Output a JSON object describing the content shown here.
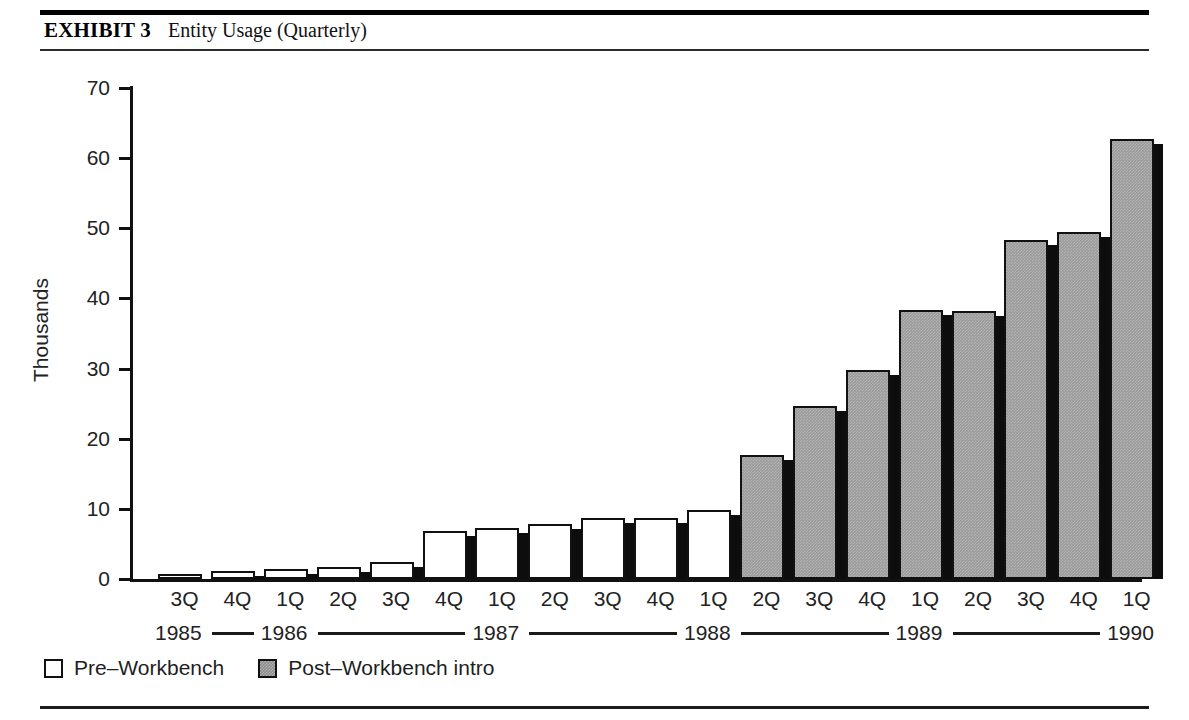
{
  "exhibit": {
    "tag": "EXHIBIT 3",
    "title": "Entity Usage (Quarterly)"
  },
  "chart_data": {
    "type": "bar",
    "title": "Entity Usage (Quarterly)",
    "xlabel": "",
    "ylabel": "Thousands",
    "ylim": [
      0,
      70
    ],
    "ytick_step": 10,
    "yticks": [
      "70",
      "60",
      "50",
      "40",
      "30",
      "20",
      "10",
      "0"
    ],
    "grid": false,
    "legend_position": "bottom-left",
    "categories": [
      "3Q",
      "4Q",
      "1Q",
      "2Q",
      "3Q",
      "4Q",
      "1Q",
      "2Q",
      "3Q",
      "4Q",
      "1Q",
      "2Q",
      "3Q",
      "4Q",
      "1Q",
      "2Q",
      "3Q",
      "4Q",
      "1Q"
    ],
    "years": [
      {
        "label": "1985",
        "span": 2
      },
      {
        "label": "1986",
        "span": 4
      },
      {
        "label": "1987",
        "span": 4
      },
      {
        "label": "1988",
        "span": 4
      },
      {
        "label": "1989",
        "span": 4
      },
      {
        "label": "1990",
        "span": 1
      }
    ],
    "series": [
      {
        "name": "Pre–Workbench",
        "color": "#ffffff",
        "values": [
          0.7,
          1.1,
          1.4,
          1.7,
          2.4,
          6.8,
          7.2,
          7.9,
          8.7,
          8.7,
          9.9,
          null,
          null,
          null,
          null,
          null,
          null,
          null,
          null
        ]
      },
      {
        "name": "Post–Workbench intro",
        "color": "#9a9a9a",
        "values": [
          null,
          null,
          null,
          null,
          null,
          null,
          null,
          null,
          null,
          null,
          null,
          17.7,
          24.7,
          29.8,
          38.3,
          38.2,
          48.3,
          49.5,
          62.8
        ]
      }
    ],
    "bars": [
      {
        "quarter": "3Q",
        "year": "1985",
        "value": 0.7,
        "series": "Pre–Workbench"
      },
      {
        "quarter": "4Q",
        "year": "1985",
        "value": 1.1,
        "series": "Pre–Workbench"
      },
      {
        "quarter": "1Q",
        "year": "1986",
        "value": 1.4,
        "series": "Pre–Workbench"
      },
      {
        "quarter": "2Q",
        "year": "1986",
        "value": 1.7,
        "series": "Pre–Workbench"
      },
      {
        "quarter": "3Q",
        "year": "1986",
        "value": 2.4,
        "series": "Pre–Workbench"
      },
      {
        "quarter": "4Q",
        "year": "1986",
        "value": 6.8,
        "series": "Pre–Workbench"
      },
      {
        "quarter": "1Q",
        "year": "1987",
        "value": 7.2,
        "series": "Pre–Workbench"
      },
      {
        "quarter": "2Q",
        "year": "1987",
        "value": 7.9,
        "series": "Pre–Workbench"
      },
      {
        "quarter": "3Q",
        "year": "1987",
        "value": 8.7,
        "series": "Pre–Workbench"
      },
      {
        "quarter": "4Q",
        "year": "1987",
        "value": 8.7,
        "series": "Pre–Workbench"
      },
      {
        "quarter": "1Q",
        "year": "1988",
        "value": 9.9,
        "series": "Pre–Workbench"
      },
      {
        "quarter": "2Q",
        "year": "1988",
        "value": 17.7,
        "series": "Post–Workbench intro"
      },
      {
        "quarter": "3Q",
        "year": "1988",
        "value": 24.7,
        "series": "Post–Workbench intro"
      },
      {
        "quarter": "4Q",
        "year": "1988",
        "value": 29.8,
        "series": "Post–Workbench intro"
      },
      {
        "quarter": "1Q",
        "year": "1989",
        "value": 38.3,
        "series": "Post–Workbench intro"
      },
      {
        "quarter": "2Q",
        "year": "1989",
        "value": 38.2,
        "series": "Post–Workbench intro"
      },
      {
        "quarter": "3Q",
        "year": "1989",
        "value": 48.3,
        "series": "Post–Workbench intro"
      },
      {
        "quarter": "4Q",
        "year": "1989",
        "value": 49.5,
        "series": "Post–Workbench intro"
      },
      {
        "quarter": "1Q",
        "year": "1990",
        "value": 62.8,
        "series": "Post–Workbench intro"
      }
    ]
  },
  "legend": {
    "items": [
      {
        "label": "Pre–Workbench",
        "swatch": "pre"
      },
      {
        "label": "Post–Workbench intro",
        "swatch": "post"
      }
    ]
  }
}
